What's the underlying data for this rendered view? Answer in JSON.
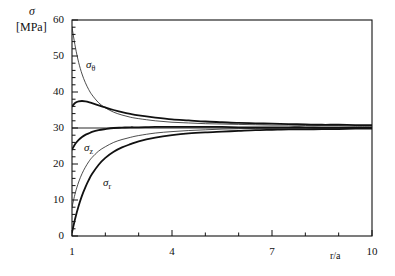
{
  "figure": {
    "background": "#ffffff",
    "ink": "#111111"
  },
  "labels": {
    "y_axis_symbol": "σ",
    "y_axis_unit": "[MPa]",
    "x_axis_title": "r/a",
    "curve_theta": "σ",
    "curve_theta_sub": "θ",
    "curve_z": "σ",
    "curve_z_sub": "z",
    "curve_r": "σ",
    "curve_r_sub": "r"
  },
  "axes": {
    "y_ticks": [
      "0",
      "10",
      "20",
      "30",
      "40",
      "50",
      "60"
    ],
    "x_ticks": [
      "1",
      "4",
      "7",
      "10"
    ]
  },
  "chart_data": {
    "type": "line",
    "title": "",
    "xlabel": "r/a",
    "ylabel": "σ [MPa]",
    "xlim": [
      1,
      10
    ],
    "ylim": [
      0,
      60
    ],
    "x_major_ticks": [
      1,
      4,
      7,
      10
    ],
    "x_minor_tick_step": 1,
    "y_major_ticks": [
      0,
      10,
      20,
      30,
      40,
      50,
      60
    ],
    "y_minor_tick_step": 2,
    "grid": false,
    "legend": "none",
    "annotations": [
      {
        "text": "σθ",
        "x": 1.55,
        "y": 45.5
      },
      {
        "text": "σz",
        "x": 1.45,
        "y": 23.0
      },
      {
        "text": "σr",
        "x": 2.1,
        "y": 14.5
      }
    ],
    "reference_line": {
      "name": "far-field stress",
      "y": 30,
      "style": "thin-solid"
    },
    "x": [
      1.0,
      1.1,
      1.2,
      1.3,
      1.4,
      1.5,
      1.6,
      1.8,
      2.0,
      2.25,
      2.5,
      2.75,
      3.0,
      3.5,
      4.0,
      4.5,
      5.0,
      5.5,
      6.0,
      6.5,
      7.0,
      7.5,
      8.0,
      8.5,
      9.0,
      9.5,
      10.0
    ],
    "series": [
      {
        "name": "σθ thin (elastic solution)",
        "style": "thin-solid",
        "values": [
          58.0,
          52.5,
          48.2,
          45.0,
          42.6,
          40.7,
          39.2,
          37.0,
          35.6,
          34.4,
          33.6,
          33.0,
          32.6,
          32.0,
          31.6,
          31.4,
          31.2,
          31.1,
          31.0,
          30.9,
          30.8,
          30.8,
          30.7,
          30.6,
          30.6,
          30.5,
          30.5
        ]
      },
      {
        "name": "σθ bold (creep solution)",
        "style": "bold-solid",
        "values": [
          36.0,
          37.0,
          37.4,
          37.5,
          37.4,
          37.2,
          36.9,
          36.3,
          35.7,
          35.0,
          34.4,
          33.9,
          33.5,
          32.9,
          32.4,
          32.1,
          31.8,
          31.6,
          31.4,
          31.3,
          31.2,
          31.1,
          31.0,
          30.9,
          30.9,
          30.8,
          30.8
        ]
      },
      {
        "name": "σz bold (creep solution)",
        "style": "bold-solid",
        "values": [
          24.0,
          25.6,
          26.7,
          27.5,
          28.1,
          28.5,
          28.9,
          29.4,
          29.7,
          30.0,
          30.1,
          30.2,
          30.2,
          30.3,
          30.3,
          30.3,
          30.3,
          30.3,
          30.2,
          30.2,
          30.2,
          30.2,
          30.2,
          30.1,
          30.1,
          30.1,
          30.1
        ]
      },
      {
        "name": "σz thin (elastic solution)",
        "style": "thin-solid",
        "values": [
          8.0,
          12.0,
          15.0,
          17.3,
          19.1,
          20.6,
          21.8,
          23.6,
          24.8,
          26.0,
          26.8,
          27.4,
          27.9,
          28.6,
          29.0,
          29.3,
          29.5,
          29.7,
          29.8,
          29.9,
          29.9,
          30.0,
          30.0,
          30.0,
          30.0,
          30.0,
          30.0
        ]
      },
      {
        "name": "σr bold (creep solution)",
        "style": "bold-solid",
        "values": [
          1.0,
          5.0,
          8.4,
          11.2,
          13.5,
          15.5,
          17.2,
          19.8,
          21.7,
          23.4,
          24.6,
          25.5,
          26.3,
          27.3,
          28.0,
          28.5,
          28.8,
          29.0,
          29.2,
          29.4,
          29.5,
          29.6,
          29.6,
          29.7,
          29.7,
          29.8,
          29.8
        ]
      }
    ]
  }
}
